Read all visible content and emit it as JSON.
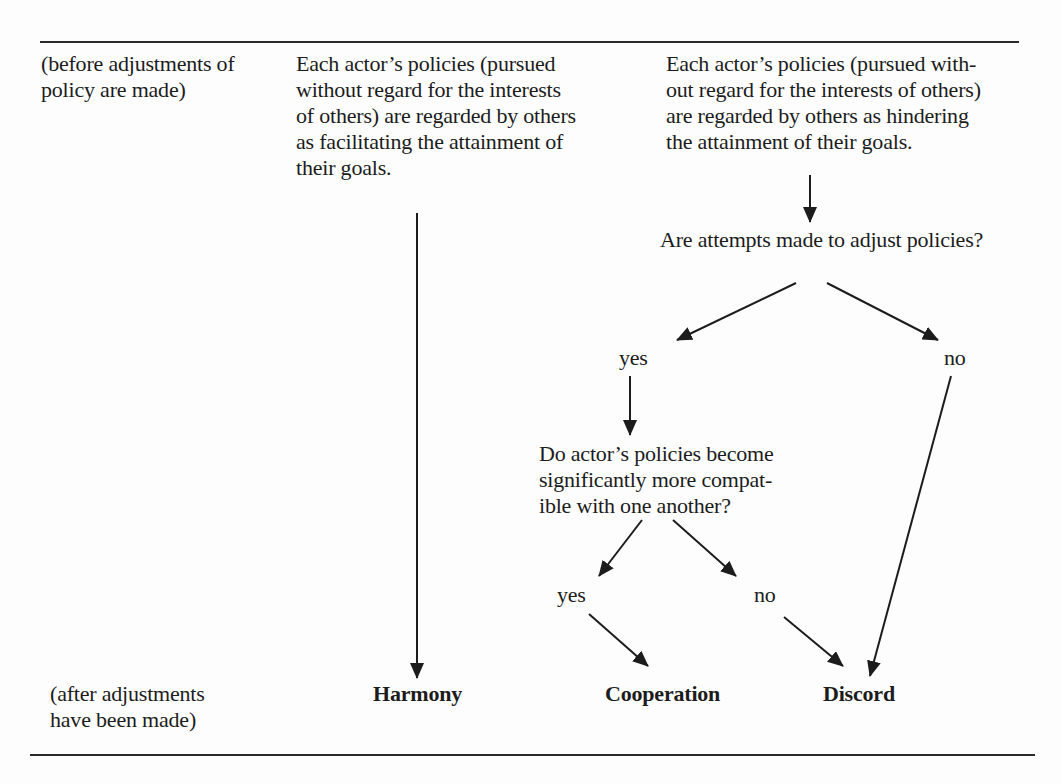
{
  "figure": {
    "row_labels": {
      "before": [
        "(before adjustments of",
        "policy are made)"
      ],
      "after": [
        "(after adjustments",
        "have been made)"
      ]
    },
    "facilitating_box": [
      "Each actor’s policies (pursued",
      "without regard for the interests",
      "of others) are regarded by others",
      "as facilitating the attainment of",
      "their goals."
    ],
    "hindering_box": [
      "Each actor’s policies (pursued with-",
      "out regard for the interests of others)",
      "are regarded by others as hindering",
      "the attainment of their goals."
    ],
    "question_1": "Are attempts made to adjust policies?",
    "question_1_yes": "yes",
    "question_1_no": "no",
    "question_2": [
      "Do actor’s policies become",
      "significantly more compat-",
      "ible with one another?"
    ],
    "question_2_yes": "yes",
    "question_2_no": "no",
    "outcomes": {
      "harmony": "Harmony",
      "cooperation": "Cooperation",
      "discord": "Discord"
    },
    "colors": {
      "ink": "#1c1c1c",
      "paper": "#fdfdfd"
    }
  }
}
